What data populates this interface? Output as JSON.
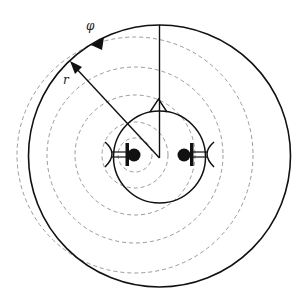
{
  "diagram": {
    "labels": {
      "phi": "φ",
      "r": "r"
    },
    "colors": {
      "stroke": "#111111",
      "dashed": "#9a9a9a",
      "background": "#ffffff"
    },
    "outer_circle": {
      "cx": 159.5,
      "cy": 156,
      "r": 131
    },
    "head_circle": {
      "cx": 159.5,
      "cy": 157,
      "r": 46
    },
    "wavefront_center": {
      "cx": 135,
      "cy": 155
    },
    "wavefront_radii": [
      17,
      33,
      60,
      88,
      118
    ]
  }
}
